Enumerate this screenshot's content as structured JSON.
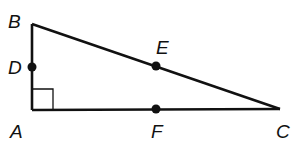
{
  "diagram": {
    "type": "right-triangle",
    "colors": {
      "stroke": "#111111",
      "background": "#ffffff"
    },
    "vertices": {
      "A": {
        "label": "A",
        "x": 32,
        "y": 110
      },
      "B": {
        "label": "B",
        "x": 32,
        "y": 24
      },
      "C": {
        "label": "C",
        "x": 280,
        "y": 109
      }
    },
    "points": {
      "D": {
        "label": "D",
        "on": "AB",
        "x": 32,
        "y": 67
      },
      "E": {
        "label": "E",
        "on": "BC",
        "x": 156,
        "y": 66
      },
      "F": {
        "label": "F",
        "on": "AC",
        "x": 156,
        "y": 109
      }
    },
    "right_angle_at": "A"
  }
}
